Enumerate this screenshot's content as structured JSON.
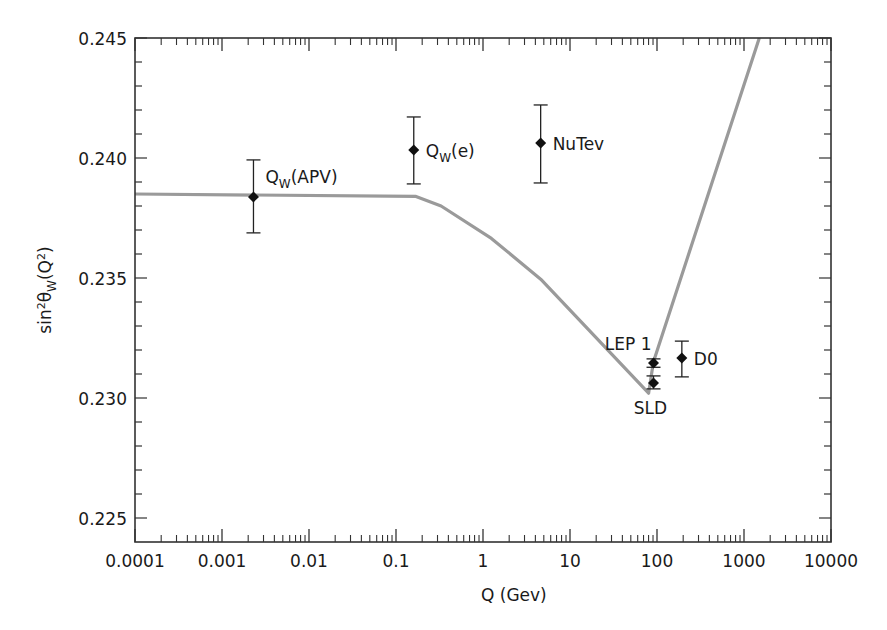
{
  "chart_data": {
    "type": "scatter",
    "title": "",
    "xlabel": "Q (Gev)",
    "ylabel": "sin²θW(Q²)",
    "ylabel_parts": {
      "pre": "sin",
      "sup1": "2",
      "theta": "θ",
      "sub": "W",
      "post_open": "(Q",
      "sup2": "2",
      "post_close": ")"
    },
    "xscale": "log",
    "xlim": [
      0.0001,
      10000
    ],
    "ylim": [
      0.224,
      0.245
    ],
    "x_ticks": [
      {
        "value": 0.0001,
        "label": "0.0001"
      },
      {
        "value": 0.001,
        "label": "0.001"
      },
      {
        "value": 0.01,
        "label": "0.01"
      },
      {
        "value": 0.1,
        "label": "0.1"
      },
      {
        "value": 1,
        "label": "1"
      },
      {
        "value": 10,
        "label": "10"
      },
      {
        "value": 100,
        "label": "100"
      },
      {
        "value": 1000,
        "label": "1000"
      },
      {
        "value": 10000,
        "label": "10000"
      }
    ],
    "y_ticks": [
      {
        "value": 0.225,
        "label": "0.225"
      },
      {
        "value": 0.23,
        "label": "0.230"
      },
      {
        "value": 0.235,
        "label": "0.235"
      },
      {
        "value": 0.24,
        "label": "0.240"
      },
      {
        "value": 0.245,
        "label": "0.245"
      }
    ],
    "y_minor_step": 0.001,
    "grid": false,
    "legend": null,
    "curve": {
      "name": "SM running sin²θW",
      "color": "#9a9a9a",
      "points": [
        [
          0.0001,
          0.2385
        ],
        [
          0.17,
          0.2384
        ],
        [
          0.33,
          0.238
        ],
        [
          1.25,
          0.23665
        ],
        [
          4.6,
          0.23495
        ],
        [
          80,
          0.2302
        ],
        [
          91,
          0.2315
        ],
        [
          1500,
          0.245
        ]
      ]
    },
    "series": [
      {
        "name": "QW(APV)",
        "label_main": "Q",
        "label_sub": "W",
        "label_rest": "(APV)",
        "x": 0.0023,
        "y": 0.23838,
        "yerr_low": 0.23688,
        "yerr_high": 0.23992,
        "label_pos": "right-above"
      },
      {
        "name": "QW(e)",
        "label_main": "Q",
        "label_sub": "W",
        "label_rest": "(e)",
        "x": 0.16,
        "y": 0.24033,
        "yerr_low": 0.23892,
        "yerr_high": 0.24171,
        "label_pos": "right"
      },
      {
        "name": "NuTev",
        "label_main": "NuTev",
        "label_sub": "",
        "label_rest": "",
        "x": 4.6,
        "y": 0.24063,
        "yerr_low": 0.23896,
        "yerr_high": 0.24221,
        "label_pos": "right"
      },
      {
        "name": "LEP 1",
        "label_main": "LEP 1",
        "label_sub": "",
        "label_rest": "",
        "x": 91.2,
        "y": 0.23146,
        "yerr_low": 0.23128,
        "yerr_high": 0.23163,
        "label_pos": "left-above"
      },
      {
        "name": "SLD",
        "label_main": "SLD",
        "label_sub": "",
        "label_rest": "",
        "x": 91.2,
        "y": 0.23063,
        "yerr_low": 0.23038,
        "yerr_high": 0.23092,
        "label_pos": "below"
      },
      {
        "name": "D0",
        "label_main": "D0",
        "label_sub": "",
        "label_rest": "",
        "x": 193,
        "y": 0.23167,
        "yerr_low": 0.23088,
        "yerr_high": 0.23237,
        "label_pos": "right"
      }
    ],
    "colors": {
      "frame": "#333333",
      "point": "#111111",
      "curve": "#9a9a9a"
    }
  }
}
